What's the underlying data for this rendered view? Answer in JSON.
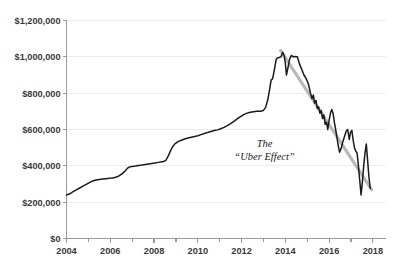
{
  "chart_data": {
    "type": "line",
    "title": "",
    "subtitle": "",
    "xlabel": "",
    "ylabel": "",
    "xlim": [
      2004,
      2018.6
    ],
    "ylim": [
      0,
      1200000
    ],
    "grid": true,
    "legend_position": "none",
    "y_ticks": [
      0,
      200000,
      400000,
      600000,
      800000,
      1000000,
      1200000
    ],
    "y_tick_labels": [
      "$0",
      "$200,000",
      "$400,000",
      "$600,000",
      "$800,000",
      "$1,000,000",
      "$1,200,000"
    ],
    "x_ticks": [
      2004,
      2006,
      2008,
      2010,
      2012,
      2014,
      2016,
      2018
    ],
    "x_tick_labels": [
      "2004",
      "2006",
      "2008",
      "2010",
      "2012",
      "2014",
      "2016",
      "2018"
    ],
    "x_minor_ticks": [
      2005,
      2007,
      2009,
      2011,
      2013,
      2015,
      2017
    ],
    "annotations": [
      {
        "name": "uber-effect-annotation",
        "lines": [
          "The",
          "“Uber Effect”"
        ],
        "x": 2013.05,
        "y": 505000
      }
    ],
    "series": [
      {
        "name": "medallion-price",
        "color": "#1a1a1a",
        "points": [
          [
            2004.0,
            240000
          ],
          [
            2004.1,
            243000
          ],
          [
            2004.2,
            249000
          ],
          [
            2004.3,
            258000
          ],
          [
            2004.45,
            268000
          ],
          [
            2004.6,
            278000
          ],
          [
            2004.75,
            288000
          ],
          [
            2004.9,
            298000
          ],
          [
            2005.05,
            308000
          ],
          [
            2005.2,
            317000
          ],
          [
            2005.35,
            322000
          ],
          [
            2005.5,
            325000
          ],
          [
            2005.65,
            327000
          ],
          [
            2005.8,
            329000
          ],
          [
            2005.95,
            331000
          ],
          [
            2006.1,
            333000
          ],
          [
            2006.25,
            337000
          ],
          [
            2006.4,
            345000
          ],
          [
            2006.55,
            357000
          ],
          [
            2006.68,
            372000
          ],
          [
            2006.78,
            386000
          ],
          [
            2006.88,
            394000
          ],
          [
            2007.0,
            397000
          ],
          [
            2007.15,
            399000
          ],
          [
            2007.3,
            402000
          ],
          [
            2007.45,
            404000
          ],
          [
            2007.6,
            407000
          ],
          [
            2007.75,
            410000
          ],
          [
            2007.9,
            413000
          ],
          [
            2008.05,
            416000
          ],
          [
            2008.2,
            419000
          ],
          [
            2008.35,
            422000
          ],
          [
            2008.45,
            424000
          ],
          [
            2008.55,
            432000
          ],
          [
            2008.65,
            455000
          ],
          [
            2008.75,
            482000
          ],
          [
            2008.85,
            505000
          ],
          [
            2008.95,
            521000
          ],
          [
            2009.1,
            533000
          ],
          [
            2009.25,
            541000
          ],
          [
            2009.4,
            548000
          ],
          [
            2009.55,
            553000
          ],
          [
            2009.7,
            557000
          ],
          [
            2009.85,
            561000
          ],
          [
            2010.0,
            566000
          ],
          [
            2010.15,
            572000
          ],
          [
            2010.3,
            578000
          ],
          [
            2010.45,
            584000
          ],
          [
            2010.6,
            589000
          ],
          [
            2010.75,
            594000
          ],
          [
            2010.9,
            598000
          ],
          [
            2011.05,
            604000
          ],
          [
            2011.2,
            612000
          ],
          [
            2011.35,
            621000
          ],
          [
            2011.5,
            632000
          ],
          [
            2011.65,
            645000
          ],
          [
            2011.8,
            658000
          ],
          [
            2011.95,
            671000
          ],
          [
            2012.1,
            682000
          ],
          [
            2012.25,
            690000
          ],
          [
            2012.4,
            695000
          ],
          [
            2012.55,
            698000
          ],
          [
            2012.7,
            700000
          ],
          [
            2012.85,
            701000
          ],
          [
            2013.0,
            705000
          ],
          [
            2013.1,
            722000
          ],
          [
            2013.2,
            765000
          ],
          [
            2013.28,
            820000
          ],
          [
            2013.35,
            872000
          ],
          [
            2013.42,
            880000
          ],
          [
            2013.5,
            930000
          ],
          [
            2013.58,
            985000
          ],
          [
            2013.65,
            995000
          ],
          [
            2013.72,
            996000
          ],
          [
            2013.8,
            1000000
          ],
          [
            2013.88,
            1025000
          ],
          [
            2013.95,
            1005000
          ],
          [
            2014.0,
            965000
          ],
          [
            2014.05,
            900000
          ],
          [
            2014.12,
            940000
          ],
          [
            2014.2,
            990000
          ],
          [
            2014.28,
            1008000
          ],
          [
            2014.36,
            1000000
          ],
          [
            2014.45,
            1002000
          ],
          [
            2014.55,
            1000000
          ],
          [
            2014.65,
            960000
          ],
          [
            2014.75,
            930000
          ],
          [
            2014.85,
            900000
          ],
          [
            2014.95,
            880000
          ],
          [
            2015.05,
            852000
          ],
          [
            2015.15,
            800000
          ],
          [
            2015.22,
            770000
          ],
          [
            2015.28,
            790000
          ],
          [
            2015.34,
            745000
          ],
          [
            2015.4,
            760000
          ],
          [
            2015.46,
            715000
          ],
          [
            2015.52,
            725000
          ],
          [
            2015.58,
            690000
          ],
          [
            2015.64,
            705000
          ],
          [
            2015.7,
            660000
          ],
          [
            2015.76,
            680000
          ],
          [
            2015.82,
            628000
          ],
          [
            2015.88,
            640000
          ],
          [
            2015.94,
            600000
          ],
          [
            2016.0,
            650000
          ],
          [
            2016.06,
            690000
          ],
          [
            2016.12,
            710000
          ],
          [
            2016.18,
            690000
          ],
          [
            2016.24,
            640000
          ],
          [
            2016.3,
            600000
          ],
          [
            2016.36,
            555000
          ],
          [
            2016.42,
            510000
          ],
          [
            2016.48,
            475000
          ],
          [
            2016.55,
            495000
          ],
          [
            2016.62,
            530000
          ],
          [
            2016.7,
            560000
          ],
          [
            2016.78,
            590000
          ],
          [
            2016.85,
            600000
          ],
          [
            2016.92,
            545000
          ],
          [
            2016.98,
            585000
          ],
          [
            2017.04,
            595000
          ],
          [
            2017.1,
            540000
          ],
          [
            2017.16,
            500000
          ],
          [
            2017.22,
            480000
          ],
          [
            2017.28,
            470000
          ],
          [
            2017.34,
            400000
          ],
          [
            2017.4,
            320000
          ],
          [
            2017.46,
            240000
          ],
          [
            2017.52,
            310000
          ],
          [
            2017.58,
            400000
          ],
          [
            2017.64,
            470000
          ],
          [
            2017.7,
            520000
          ],
          [
            2017.76,
            430000
          ],
          [
            2017.82,
            340000
          ],
          [
            2017.88,
            275000
          ]
        ]
      }
    ],
    "trend_line": {
      "name": "uber-effect-trend",
      "color": "#b8b8b8",
      "points": [
        [
          2013.78,
          1035000
        ],
        [
          2017.95,
          268000
        ]
      ]
    }
  }
}
